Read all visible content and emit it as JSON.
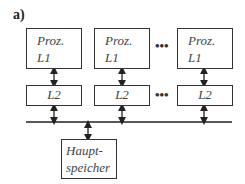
{
  "figure_label": "a)",
  "processors": [
    {
      "line1": "Proz.",
      "line2": "L1"
    },
    {
      "line1": "Proz.",
      "line2": "L1"
    },
    {
      "line1": "Proz.",
      "line2": "L1"
    }
  ],
  "l2_caches": [
    {
      "label": "L2"
    },
    {
      "label": "L2"
    },
    {
      "label": "L2"
    }
  ],
  "ellipsis": "•••",
  "main_memory": {
    "line1": "Haupt-",
    "line2": "speicher"
  },
  "colors": {
    "stroke": "#333333",
    "text": "#444444",
    "background": "#ffffff"
  }
}
